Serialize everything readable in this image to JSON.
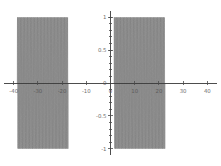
{
  "chart_data": {
    "type": "line",
    "title": "",
    "subtitle": "",
    "xlabel": "",
    "ylabel": "",
    "xlim": [
      -44,
      44
    ],
    "ylim": [
      -1.08,
      1.08
    ],
    "grid": false,
    "legend": null,
    "xticks": [
      -40,
      -30,
      -20,
      -10,
      0,
      10,
      20,
      30,
      40
    ],
    "xticklabels": [
      "-40",
      "-30",
      "-20",
      "-10",
      "0",
      "10",
      "20",
      "30",
      "40"
    ],
    "yticks": [
      -1,
      -0.5,
      0,
      0.5,
      1
    ],
    "yticklabels": [
      "-1",
      "-0.5",
      "0",
      "0.5",
      "1"
    ],
    "series": [
      {
        "name": "oscillation",
        "color": "#6e6e6e",
        "amplitude": 1,
        "segments": [
          {
            "x_start": -38.5,
            "x_end": -17.5,
            "cycles": 66
          },
          {
            "x_start": 1.5,
            "x_end": 22.5,
            "cycles": 66
          }
        ]
      }
    ],
    "axis_color": "#3a3a3a",
    "tick_color": "#4a4a4a",
    "label_color": "#555555",
    "background": "#ffffff"
  },
  "figure": {
    "width": 221,
    "height": 166,
    "plot_left": 4,
    "plot_right": 217,
    "plot_top": 12,
    "plot_bottom": 154,
    "origin_x": 110,
    "origin_y": 83
  }
}
